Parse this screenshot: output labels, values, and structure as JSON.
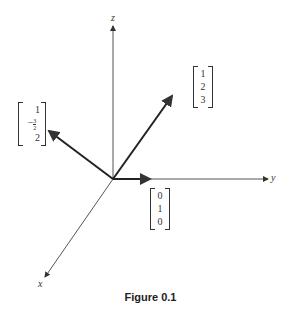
{
  "diagram": {
    "axes": {
      "x": "x",
      "y": "y",
      "z": "z"
    },
    "vectors": [
      {
        "name": "vector-a",
        "components": [
          "1",
          "2",
          "3"
        ]
      },
      {
        "name": "vector-b",
        "components": [
          "1",
          "−",
          "3",
          "2",
          "2"
        ],
        "display": [
          "1",
          "-3/2",
          "2"
        ]
      },
      {
        "name": "vector-c",
        "components": [
          "0",
          "1",
          "0"
        ]
      }
    ],
    "caption": "Figure 0.1"
  }
}
